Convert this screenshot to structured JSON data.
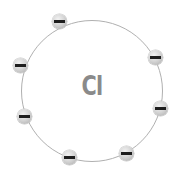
{
  "diagram": {
    "nucleus_label": "Cl",
    "colors": {
      "shell": "#b0b0b0",
      "nucleus_text": "#8a8a8a",
      "electron": "#d6d6d6",
      "charge_bar": "#1e1e1e"
    },
    "shell": {
      "cx": 92,
      "cy": 91,
      "r": 71
    },
    "electrons": [
      {
        "id": 1,
        "charge": "-",
        "x": 59,
        "y": 21
      },
      {
        "id": 2,
        "charge": "-",
        "x": 155,
        "y": 57
      },
      {
        "id": 3,
        "charge": "-",
        "x": 20,
        "y": 65
      },
      {
        "id": 4,
        "charge": "-",
        "x": 160,
        "y": 108
      },
      {
        "id": 5,
        "charge": "-",
        "x": 24,
        "y": 116
      },
      {
        "id": 6,
        "charge": "-",
        "x": 126,
        "y": 153
      },
      {
        "id": 7,
        "charge": "-",
        "x": 69,
        "y": 157
      }
    ],
    "electron_count": 7
  }
}
